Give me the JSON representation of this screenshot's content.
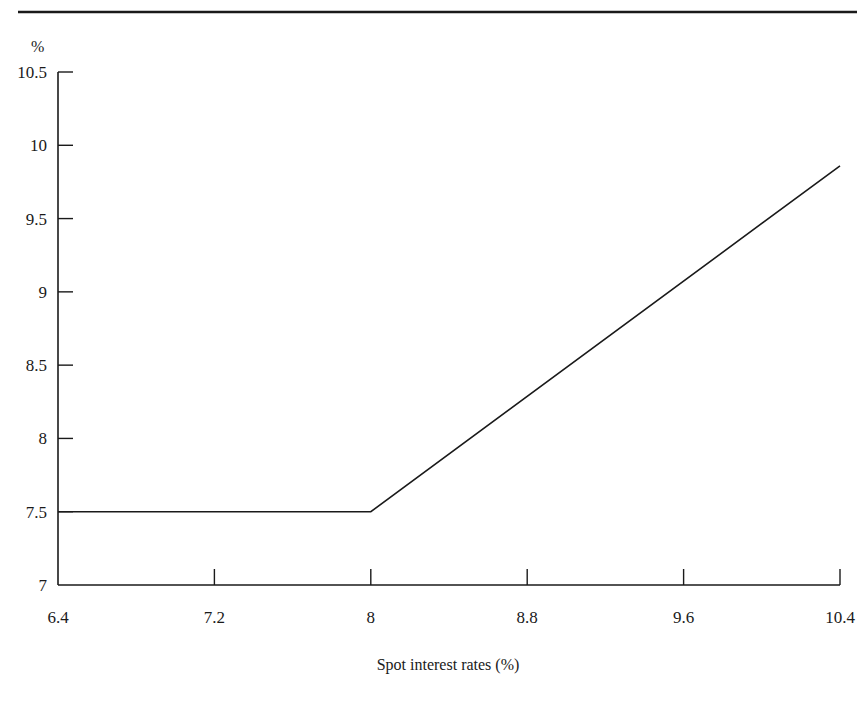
{
  "chart_data": {
    "type": "line",
    "title": "",
    "xlabel": "Spot interest rates (%)",
    "ylabel": "%",
    "xlim": [
      6.4,
      10.4
    ],
    "ylim": [
      7,
      10.5
    ],
    "x_ticks": [
      "6.4",
      "7.2",
      "8",
      "8.8",
      "9.6",
      "10.4"
    ],
    "y_ticks": [
      "7",
      "7.5",
      "8",
      "8.5",
      "9",
      "9.5",
      "10",
      "10.5"
    ],
    "grid": false,
    "legend": null,
    "series": [
      {
        "name": "rate",
        "x": [
          6.4,
          8.0,
          10.4
        ],
        "y": [
          7.5,
          7.5,
          9.86
        ]
      }
    ]
  }
}
